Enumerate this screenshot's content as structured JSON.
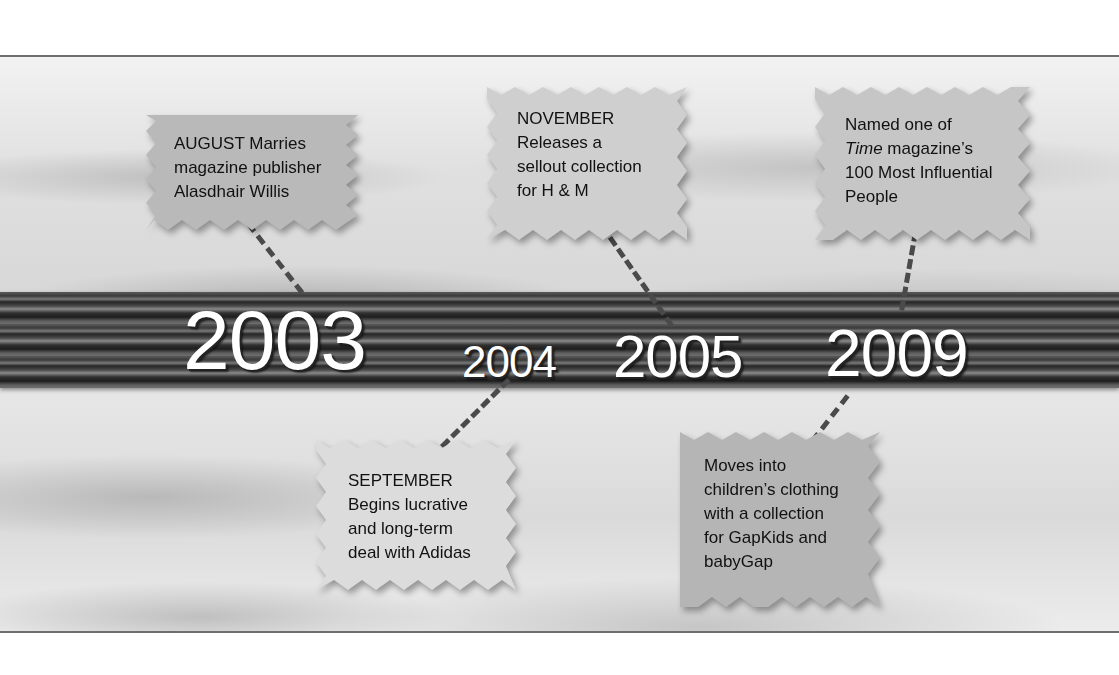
{
  "timeline": {
    "years": [
      {
        "label": "2003",
        "size": "large"
      },
      {
        "label": "2004",
        "size": "small"
      },
      {
        "label": "2005",
        "size": "medium"
      },
      {
        "label": "2009",
        "size": "medium"
      }
    ],
    "events": [
      {
        "id": "2003-august",
        "year": "2003",
        "position": "top",
        "month": "AUGUST",
        "lines": [
          "AUGUST  Marries",
          "magazine publisher",
          "Alasdhair Willis"
        ]
      },
      {
        "id": "2005-november",
        "year": "2005",
        "position": "top",
        "month": "NOVEMBER",
        "lines": [
          "NOVEMBER",
          "Releases a",
          "sellout collection",
          "for H & M"
        ]
      },
      {
        "id": "2009-time",
        "year": "2009",
        "position": "top",
        "month": "",
        "lines": [
          "Named one of",
          "Time magazine’s",
          "100 Most Influential",
          "People"
        ],
        "italic_word": "Time"
      },
      {
        "id": "2004-september",
        "year": "2004",
        "position": "bottom",
        "month": "SEPTEMBER",
        "lines": [
          "SEPTEMBER",
          "Begins lucrative",
          "and long-term",
          "deal with Adidas"
        ]
      },
      {
        "id": "2009-gap",
        "year": "2009",
        "position": "bottom",
        "month": "",
        "lines": [
          "Moves into",
          "children’s clothing",
          "with a collection",
          "for GapKids and",
          "babyGap"
        ]
      }
    ]
  },
  "colors": {
    "card_dark": "#b8b8b8",
    "card_light": "#dedede",
    "year_text": "#ffffff",
    "dash": "#4a4a4a"
  }
}
